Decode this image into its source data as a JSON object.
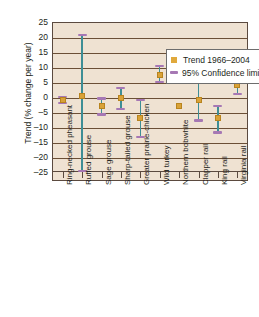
{
  "chart_data": {
    "type": "scatter",
    "title": "",
    "xlabel": "",
    "ylabel": "Trend (% change per year)",
    "ylim": [
      -25,
      25
    ],
    "yticks": [
      25,
      20,
      15,
      10,
      5,
      0,
      -5,
      -10,
      -15,
      -20,
      -25
    ],
    "ytick_labels": [
      "25",
      "20",
      "15",
      "10",
      "5",
      "0",
      "–5",
      "–10",
      "–15",
      "–20",
      "–25"
    ],
    "grid": true,
    "legend_position": "top-right",
    "categories": [
      "Ring-necked pheasant",
      "Ruffed grouse",
      "Sage grouse",
      "Sharp-tailed grouse",
      "Greater prairie-chicken",
      "Wild turkey",
      "Northern bobwhite",
      "Clapper rail",
      "King rail",
      "Virginia rail"
    ],
    "series": [
      {
        "name": "Trend 1966–2004",
        "values": [
          -1.0,
          0.3,
          -3.0,
          -0.3,
          -7.0,
          7.5,
          -3.0,
          -1.0,
          -7.0,
          4.0
        ]
      },
      {
        "name": "95% Confidence limits lower",
        "values": [
          -2.0,
          -25.0,
          -6.0,
          -4.0,
          -13.5,
          5.0,
          null,
          -8.0,
          -12.0,
          1.0
        ]
      },
      {
        "name": "95% Confidence limits upper",
        "values": [
          0.0,
          21.0,
          -0.5,
          3.0,
          -1.0,
          10.5,
          null,
          5.0,
          -3.0,
          7.0
        ]
      }
    ]
  },
  "legend": {
    "items": [
      {
        "label": "Trend 1966–2004",
        "marker": "square-marker-icon",
        "color": "#e0a93c"
      },
      {
        "label": "95% Confidence limits",
        "marker": "dash-marker-icon",
        "color": "#a678b4"
      }
    ]
  },
  "colors": {
    "plot_background": "#efe2d2",
    "gridline": "#6b4f36",
    "axis": "#5b4a3f",
    "trend_marker": "#d9a238",
    "confidence_cap": "#a678b4",
    "whisker": "#3e8e95",
    "text": "#231f20"
  }
}
